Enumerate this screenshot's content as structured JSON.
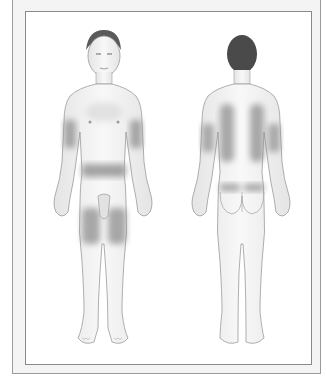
{
  "diagram": {
    "views": [
      {
        "id": "front",
        "label": "",
        "shaded_regions": [
          "upper-arm-left",
          "upper-arm-right",
          "abdomen-band",
          "thigh-left",
          "thigh-right"
        ]
      },
      {
        "id": "back",
        "label": "",
        "shaded_regions": [
          "upper-back-left",
          "upper-back-right",
          "upper-arm-left",
          "upper-arm-right",
          "lower-back-left",
          "lower-back-right"
        ]
      }
    ]
  },
  "colors": {
    "frame_border": "#8a8a8a",
    "outer_bg": "#f4f4f4",
    "panel_bg": "#ffffff",
    "skin": "#f0f0f0",
    "outline": "#9a9a9a",
    "shaded_region": "#8e8e8e",
    "hair": "#4a4a4a"
  }
}
